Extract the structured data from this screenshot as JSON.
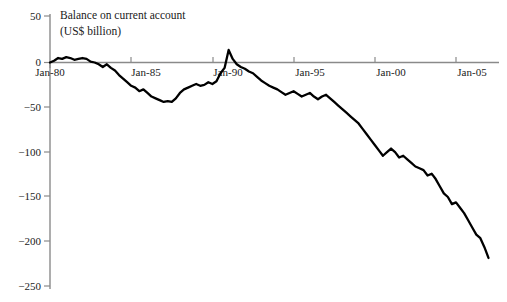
{
  "chart_data": {
    "type": "line",
    "title": "Balance on current account",
    "subtitle": "(US$ billion)",
    "xlabel": "",
    "ylabel": "",
    "ylim": [
      -250,
      50
    ],
    "xlim": [
      "Jan-80",
      "Jan-07"
    ],
    "grid": false,
    "legend": null,
    "y_ticks": [
      50,
      0,
      -50,
      -100,
      -150,
      -200,
      -250
    ],
    "y_tick_labels": [
      "50",
      "0",
      "−50",
      "−100",
      "−150",
      "−200",
      "−250"
    ],
    "x_ticks": [
      "Jan-80",
      "Jan-85",
      "Jan-90",
      "Jan-95",
      "Jan-00",
      "Jan-05"
    ],
    "x_tick_labels": [
      "Jan-80",
      "Jan-85",
      "Jan-90",
      "Jan-95",
      "Jan-00",
      "Jan-05"
    ],
    "line_color": "#000000",
    "axis_color": "#808080",
    "series": [
      {
        "name": "Balance on current account",
        "x": [
          1980.0,
          1980.25,
          1980.5,
          1980.75,
          1981.0,
          1981.25,
          1981.5,
          1981.75,
          1982.0,
          1982.25,
          1982.5,
          1982.75,
          1983.0,
          1983.25,
          1983.5,
          1983.75,
          1984.0,
          1984.25,
          1984.5,
          1984.75,
          1985.0,
          1985.25,
          1985.5,
          1985.75,
          1986.0,
          1986.25,
          1986.5,
          1986.75,
          1987.0,
          1987.25,
          1987.5,
          1987.75,
          1988.0,
          1988.25,
          1988.5,
          1988.75,
          1989.0,
          1989.25,
          1989.5,
          1989.75,
          1990.0,
          1990.25,
          1990.5,
          1990.75,
          1991.0,
          1991.25,
          1991.5,
          1991.75,
          1992.0,
          1992.25,
          1992.5,
          1992.75,
          1993.0,
          1993.25,
          1993.5,
          1993.75,
          1994.0,
          1994.25,
          1994.5,
          1994.75,
          1995.0,
          1995.25,
          1995.5,
          1995.75,
          1996.0,
          1996.25,
          1996.5,
          1996.75,
          1997.0,
          1997.25,
          1997.5,
          1997.75,
          1998.0,
          1998.25,
          1998.5,
          1998.75,
          1999.0,
          1999.25,
          1999.5,
          1999.75,
          2000.0,
          2000.25,
          2000.5,
          2000.75,
          2001.0,
          2001.25,
          2001.5,
          2001.75,
          2002.0,
          2002.25,
          2002.5,
          2002.75,
          2003.0,
          2003.25,
          2003.5,
          2003.75,
          2004.0,
          2004.25,
          2004.5,
          2004.75,
          2005.0,
          2005.25,
          2005.5,
          2005.75,
          2006.0,
          2006.25,
          2006.5,
          2006.75,
          2007.0
        ],
        "values": [
          0,
          2,
          5,
          4,
          6,
          5,
          3,
          4,
          5,
          4,
          1,
          0,
          -2,
          -5,
          -2,
          -6,
          -9,
          -14,
          -18,
          -22,
          -26,
          -28,
          -32,
          -30,
          -34,
          -38,
          -40,
          -42,
          -44,
          -43,
          -44,
          -40,
          -34,
          -30,
          -28,
          -26,
          -24,
          -26,
          -25,
          -22,
          -24,
          -21,
          -12,
          -6,
          14,
          4,
          -2,
          -5,
          -7,
          -10,
          -12,
          -16,
          -20,
          -23,
          -26,
          -28,
          -30,
          -33,
          -36,
          -34,
          -32,
          -35,
          -38,
          -36,
          -34,
          -38,
          -41,
          -38,
          -36,
          -40,
          -44,
          -48,
          -52,
          -56,
          -60,
          -64,
          -68,
          -74,
          -80,
          -86,
          -92,
          -98,
          -104,
          -100,
          -96,
          -100,
          -106,
          -104,
          -108,
          -112,
          -116,
          -118,
          -120,
          -126,
          -124,
          -130,
          -138,
          -146,
          -150,
          -158,
          -156,
          -162,
          -168,
          -176,
          -184,
          -192,
          -196,
          -206,
          -218
        ]
      }
    ]
  },
  "axes": {
    "y_axis_name": "y-axis",
    "x_axis_name": "x-axis"
  }
}
